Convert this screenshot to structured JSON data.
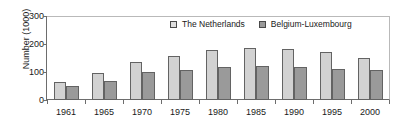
{
  "chart_data": {
    "type": "bar",
    "title": "",
    "subtitle": "",
    "xlabel": "",
    "ylabel": "Number (1000)",
    "categories": [
      "1961",
      "1965",
      "1970",
      "1975",
      "1980",
      "1985",
      "1990",
      "1995",
      "2000"
    ],
    "series": [
      {
        "name": "The Netherlands",
        "color": "#d2d2d2",
        "values": [
          63,
          95,
          137,
          156,
          179,
          184,
          182,
          172,
          151
        ]
      },
      {
        "name": "Belgium-Luxembourg",
        "color": "#9a9a9a",
        "values": [
          49,
          67,
          101,
          107,
          118,
          121,
          118,
          112,
          107
        ]
      }
    ],
    "ylim": [
      0,
      300
    ],
    "yticks": [
      0,
      100,
      200,
      300
    ],
    "ytick_labels": [
      "0",
      "100",
      "200",
      "300"
    ],
    "grid": false,
    "legend_position": "top-center"
  },
  "axes": {
    "y_title": "Number (1000)",
    "y_tick_labels": [
      "300",
      "200",
      "100",
      "0"
    ],
    "x_tick_labels": [
      "1961",
      "1965",
      "1970",
      "1975",
      "1980",
      "1985",
      "1990",
      "1995",
      "2000"
    ]
  },
  "legend": {
    "entries": [
      {
        "label": "The Netherlands",
        "swatch": "legend-swatch-light"
      },
      {
        "label": "Belgium-Luxembourg",
        "swatch": "legend-swatch-dark"
      }
    ]
  },
  "colors": {
    "series_netherlands": "#d2d2d2",
    "series_belgium_luxembourg": "#9a9a9a",
    "bar_border": "#636363",
    "axis": "#6d6d6d",
    "text": "#1a1a1a",
    "background": "#ffffff"
  }
}
